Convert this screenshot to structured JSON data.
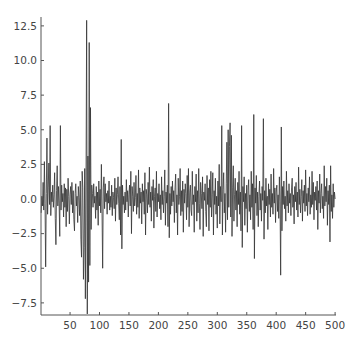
{
  "chart_data": {
    "type": "line",
    "title": "",
    "xlabel": "",
    "ylabel": "",
    "xlim": [
      0,
      500
    ],
    "ylim": [
      -8.7,
      13.0
    ],
    "grid": false,
    "legend": null,
    "x_ticks": [
      50,
      100,
      150,
      200,
      250,
      300,
      350,
      400,
      450,
      500
    ],
    "x_tick_labels": [
      "50",
      "100",
      "150",
      "200",
      "250",
      "300",
      "350",
      "400",
      "450",
      "500"
    ],
    "y_ticks": [
      12.5,
      10.0,
      7.5,
      5.0,
      2.5,
      0.0,
      -2.5,
      -5.0,
      -7.5
    ],
    "y_tick_labels": [
      "12.5",
      "10.0",
      "7.5",
      "5.0",
      "2.5",
      "0.0",
      "−2.5",
      "−5.0",
      "−7.5"
    ],
    "line_color": "#333333",
    "series": [
      {
        "name": "series",
        "x_start": 1,
        "values": [
          -1.0,
          0.2,
          -0.5,
          1.2,
          -0.8,
          2.7,
          -0.3,
          -4.9,
          0.4,
          4.4,
          -1.1,
          0.8,
          2.6,
          -0.4,
          5.3,
          -1.2,
          0.5,
          -0.2,
          1.0,
          -0.6,
          0.3,
          1.9,
          -1.4,
          -3.3,
          0.6,
          2.4,
          -0.5,
          0.9,
          -0.3,
          -2.7,
          5.3,
          -0.8,
          1.0,
          -0.2,
          0.4,
          -1.3,
          1.1,
          -0.6,
          0.8,
          -2.0,
          0.7,
          -0.9,
          1.5,
          0.2,
          -1.8,
          0.3,
          0.9,
          -0.4,
          1.2,
          -1.0,
          0.6,
          -1.5,
          -2.3,
          0.4,
          1.1,
          -0.5,
          0.2,
          -1.7,
          0.9,
          0.1,
          -1.2,
          1.3,
          -2.9,
          -4.2,
          2.0,
          0.8,
          -5.8,
          -3.5,
          2.2,
          -7.2,
          1.0,
          12.9,
          -8.3,
          3.1,
          -6.0,
          11.3,
          -4.8,
          6.6,
          -2.2,
          1.0,
          0.4,
          -0.6,
          1.1,
          -0.3,
          0.2,
          -1.4,
          0.9,
          -0.8,
          0.5,
          -1.9,
          1.3,
          -0.5,
          0.7,
          -1.0,
          2.5,
          -0.9,
          -5.0,
          0.8,
          1.6,
          -0.7,
          1.1,
          -0.2,
          0.4,
          -1.1,
          0.6,
          -0.3,
          1.3,
          -0.8,
          0.2,
          -0.6,
          1.0,
          -1.2,
          0.5,
          0.1,
          -0.7,
          1.5,
          -1.6,
          0.8,
          -0.4,
          0.3,
          1.6,
          -0.3,
          -1.5,
          0.9,
          -2.6,
          4.3,
          -3.6,
          1.0,
          -0.4,
          0.2,
          -1.0,
          0.5,
          -0.8,
          1.4,
          -0.2,
          0.6,
          -1.3,
          0.3,
          1.0,
          -0.5,
          2.0,
          -2.5,
          0.9,
          0.2,
          -0.9,
          1.2,
          -0.5,
          0.1,
          1.7,
          -1.1,
          0.4,
          -0.6,
          2.1,
          -1.4,
          0.8,
          -0.3,
          0.5,
          -1.8,
          1.1,
          -0.2,
          0.6,
          -1.1,
          1.9,
          -2.6,
          0.7,
          0.3,
          -1.0,
          1.2,
          -0.4,
          2.3,
          -0.6,
          0.5,
          -1.6,
          0.9,
          -0.1,
          1.4,
          -2.1,
          0.2,
          0.8,
          -0.9,
          2.0,
          -1.3,
          0.4,
          -0.2,
          1.1,
          -0.7,
          0.3,
          -1.5,
          1.6,
          -0.4,
          0.6,
          -1.0,
          0.2,
          2.1,
          -1.9,
          0.5,
          -0.3,
          1.0,
          -2.0,
          6.9,
          -2.8,
          0.4,
          -1.1,
          0.9,
          -0.5,
          1.3,
          -0.2,
          0.6,
          -1.7,
          0.8,
          1.8,
          -1.0,
          0.3,
          -2.6,
          1.5,
          -0.4,
          0.2,
          2.2,
          -1.2,
          0.6,
          -0.9,
          1.3,
          -2.4,
          0.7,
          -0.3,
          1.1,
          0.4,
          -1.5,
          1.7,
          -0.6,
          2.2,
          -2.0,
          0.5,
          1.0,
          -0.8,
          -1.2,
          2.0,
          -0.4,
          0.3,
          -2.4,
          0.9,
          -0.2,
          1.8,
          -1.6,
          0.6,
          -1.0,
          2.2,
          -0.3,
          -2.2,
          1.2,
          0.4,
          -0.7,
          1.6,
          -2.7,
          0.5,
          -0.1,
          1.1,
          -0.9,
          -2.0,
          1.7,
          -0.4,
          0.8,
          -2.3,
          1.4,
          -0.6,
          2.0,
          -1.3,
          0.3,
          1.9,
          -2.6,
          0.6,
          -0.4,
          1.5,
          -1.1,
          0.2,
          -2.1,
          1.3,
          -0.5,
          2.5,
          -1.8,
          0.9,
          -0.2,
          5.3,
          -2.6,
          0.7,
          1.9,
          -1.0,
          0.4,
          -2.4,
          1.1,
          4.1,
          -1.5,
          5.0,
          -0.6,
          3.8,
          5.5,
          -1.3,
          4.6,
          -2.7,
          0.8,
          2.4,
          -1.6,
          0.3,
          1.5,
          -0.8,
          0.6,
          -2.0,
          1.2,
          -0.4,
          2.0,
          -1.1,
          0.5,
          -2.3,
          5.3,
          -3.5,
          0.9,
          -0.2,
          1.6,
          -1.9,
          0.4,
          -0.7,
          1.0,
          -2.4,
          0.6,
          1.4,
          -0.9,
          0.3,
          -1.5,
          2.0,
          -0.6,
          1.1,
          -2.2,
          6.1,
          -4.3,
          0.8,
          -0.3,
          1.7,
          -1.2,
          0.5,
          -2.0,
          0.2,
          1.3,
          -0.8,
          0.4,
          -1.6,
          0.9,
          -0.1,
          5.8,
          -2.9,
          0.6,
          -1.0,
          1.5,
          -0.5,
          0.2,
          -2.2,
          1.1,
          -0.4,
          0.7,
          -1.3,
          1.8,
          -0.6,
          0.4,
          -1.1,
          2.2,
          -0.3,
          0.8,
          -1.7,
          0.5,
          1.0,
          -0.9,
          0.3,
          -1.4,
          1.6,
          -0.2,
          -5.5,
          5.2,
          -2.3,
          0.9,
          -0.4,
          1.3,
          -0.7,
          0.2,
          -1.6,
          2.0,
          -0.5,
          0.6,
          -1.0,
          1.1,
          -0.3,
          0.4,
          -1.2,
          0.8,
          1.5,
          -0.6,
          0.3,
          -1.8,
          0.9,
          -0.2,
          1.2,
          -0.8,
          0.5,
          -1.3,
          2.3,
          -0.4,
          0.7,
          -1.0,
          0.2,
          1.4,
          -1.6,
          0.6,
          -0.3,
          1.0,
          -0.9,
          2.1,
          -0.5,
          0.4,
          -1.2,
          0.8,
          -0.2,
          1.6,
          -1.1,
          0.3,
          -0.6,
          2.0,
          -0.4,
          1.2,
          -1.5,
          0.5,
          -0.1,
          0.9,
          -0.8,
          1.3,
          -2.2,
          0.6,
          -0.3,
          1.8,
          -1.0,
          0.4,
          1.1,
          -0.7,
          0.2,
          -1.4,
          2.4,
          -0.5,
          0.9,
          -0.2,
          1.5,
          -1.9,
          0.6,
          -0.4,
          1.0,
          -3.1,
          2.4,
          -0.9,
          0.3,
          -1.4,
          1.1,
          -0.6,
          0.5,
          0.0
        ]
      }
    ]
  }
}
